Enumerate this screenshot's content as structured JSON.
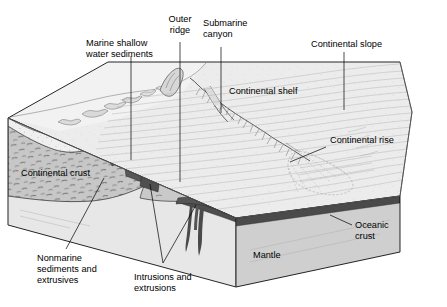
{
  "figure": {
    "type": "geologic-cross-section-block-diagram",
    "background_color": "#ffffff",
    "width": 447,
    "height": 307
  },
  "labels": {
    "marine_shallow_water_sediments": {
      "line1": "Marine shallow",
      "line2": "water sediments"
    },
    "outer_ridge": {
      "line1": "Outer",
      "line2": "ridge"
    },
    "submarine_canyon": {
      "line1": "Submarine",
      "line2": "canyon"
    },
    "continental_slope": "Continental slope",
    "continental_shelf": "Continental shelf",
    "continental_rise": "Continental rise",
    "continental_crust": "Continental crust",
    "oceanic_crust": {
      "line1": "Oceanic",
      "line2": "crust"
    },
    "mantle": "Mantle",
    "nonmarine_sediments_and_extrusives": {
      "line1": "Nonmarine",
      "line2": "sediments and",
      "line3": "extrusives"
    },
    "intrusions_and_extrusions": {
      "line1": "Intrusions and",
      "line2": "extrusions"
    }
  },
  "colors": {
    "background": "#ffffff",
    "outline": "#000000",
    "leader_line": "#000000",
    "continental_crust_fill": "#c9c9c9",
    "mantle_front_fill": "#e6e6e6",
    "mantle_side_fill": "#cfcfcf",
    "oceanic_crust_dark": "#4a4a4a",
    "intrusion_dark": "#5a5a5a",
    "seafloor_surface": "#ededed",
    "shelf_surface": "#e8e8e8",
    "sediment_stipple_fill": "#f5f5f5",
    "nonmarine_wedge": "#f0f0f0",
    "hairline_gray": "#8d8d8d"
  },
  "features": [
    {
      "name": "continental-shelf",
      "kind": "surface"
    },
    {
      "name": "continental-slope",
      "kind": "surface"
    },
    {
      "name": "continental-rise",
      "kind": "surface"
    },
    {
      "name": "submarine-canyon",
      "kind": "erosional-feature"
    },
    {
      "name": "submarine-fan",
      "kind": "depositional-feature"
    },
    {
      "name": "outer-ridge",
      "kind": "structural-high"
    },
    {
      "name": "continental-crust",
      "kind": "layer"
    },
    {
      "name": "oceanic-crust",
      "kind": "layer"
    },
    {
      "name": "mantle",
      "kind": "layer"
    },
    {
      "name": "marine-shallow-water-sediments",
      "kind": "layer"
    },
    {
      "name": "nonmarine-sediments-and-extrusives",
      "kind": "layer"
    },
    {
      "name": "intrusions-and-extrusions",
      "kind": "igneous-bodies"
    }
  ]
}
